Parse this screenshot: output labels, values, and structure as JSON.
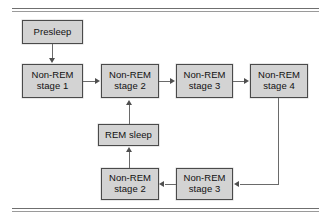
{
  "figure": {
    "rules": {
      "top_label": "top-double-rule",
      "bottom_label": "bottom-double-rule"
    },
    "box_fill": "#d3d3d3",
    "box_border": "#4a4a4a",
    "arrow_color": "#4f4f4f"
  },
  "nodes": [
    {
      "id": "presleep",
      "line1": "Presleep",
      "line2": "",
      "x": 22,
      "y": 20,
      "w": 61,
      "h": 24
    },
    {
      "id": "nrem1",
      "line1": "Non-REM",
      "line2": "stage 1",
      "x": 22,
      "y": 64,
      "w": 61,
      "h": 34
    },
    {
      "id": "nrem2-top",
      "line1": "Non-REM",
      "line2": "stage 2",
      "x": 101,
      "y": 64,
      "w": 58,
      "h": 34
    },
    {
      "id": "nrem3-top",
      "line1": "Non-REM",
      "line2": "stage 3",
      "x": 176,
      "y": 64,
      "w": 57,
      "h": 34
    },
    {
      "id": "nrem4",
      "line1": "Non-REM",
      "line2": "stage 4",
      "x": 250,
      "y": 64,
      "w": 58,
      "h": 34
    },
    {
      "id": "rem-sleep",
      "line1": "REM sleep",
      "line2": "",
      "x": 98,
      "y": 124,
      "w": 61,
      "h": 22
    },
    {
      "id": "nrem2-bottom",
      "line1": "Non-REM",
      "line2": "stage 2",
      "x": 101,
      "y": 168,
      "w": 58,
      "h": 32
    },
    {
      "id": "nrem3-bottom",
      "line1": "Non-REM",
      "line2": "stage 3",
      "x": 176,
      "y": 168,
      "w": 57,
      "h": 32
    }
  ],
  "edges": [
    {
      "id": "presleep-to-nrem1",
      "from": "presleep",
      "to": "nrem1",
      "direction": "down"
    },
    {
      "id": "nrem1-to-nrem2",
      "from": "nrem1",
      "to": "nrem2-top",
      "direction": "right"
    },
    {
      "id": "nrem2-to-nrem3",
      "from": "nrem2-top",
      "to": "nrem3-top",
      "direction": "right"
    },
    {
      "id": "nrem3-to-nrem4",
      "from": "nrem3-top",
      "to": "nrem4",
      "direction": "right"
    },
    {
      "id": "nrem4-to-nrem3-bottom",
      "from": "nrem4",
      "to": "nrem3-bottom",
      "direction": "down-left"
    },
    {
      "id": "nrem3b-to-nrem2b",
      "from": "nrem3-bottom",
      "to": "nrem2-bottom",
      "direction": "left"
    },
    {
      "id": "nrem2b-to-rem",
      "from": "nrem2-bottom",
      "to": "rem-sleep",
      "direction": "up"
    },
    {
      "id": "rem-to-nrem2-top",
      "from": "rem-sleep",
      "to": "nrem2-top",
      "direction": "up"
    }
  ]
}
